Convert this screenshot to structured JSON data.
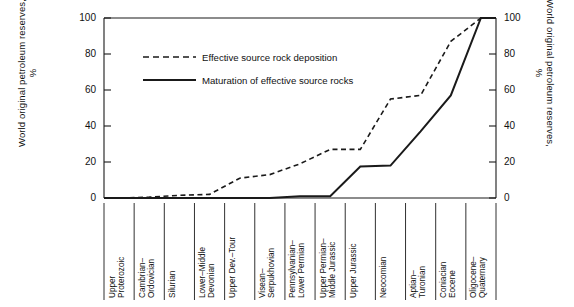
{
  "chart_data": {
    "type": "line",
    "title": "",
    "subtitle": "",
    "xlabel": "",
    "ylabel": "World original petroleum reserves, %",
    "ylabel_right": "World original petroleum reserves, %",
    "ylim": [
      0,
      100
    ],
    "yticks": [
      0,
      20,
      40,
      60,
      80,
      100
    ],
    "ytick_labels": [
      "0",
      "20",
      "40",
      "60",
      "80",
      "100"
    ],
    "ytick_labels_right": [
      "0",
      "20",
      "40",
      "60",
      "80",
      "100"
    ],
    "grid": false,
    "legend_position": "upper-left-inside",
    "categories": [
      "Upper\nProterozoic",
      "Cambrian–\nOrdovician",
      "Silurian",
      "Lower–Middle\nDevonian",
      "Upper Dev.–Tour",
      "Visean–\nSerpukhovian",
      "Pennsylvanian–\nLower Permian",
      "Upper Permian–\nMiddle Jurassic",
      "Upper Jurassic",
      "Neocomian",
      "Aptian–\nTuronian",
      "Coniacian\nEocene",
      "Oligocene–\nQuaternary"
    ],
    "series": [
      {
        "name": "Effective source rock deposition",
        "style": "dashed",
        "color": "#1a1a1a",
        "values": [
          0,
          0.5,
          1.5,
          2.0,
          11.0,
          13.0,
          19.0,
          27.0,
          27.0,
          55.0,
          57.0,
          87.0,
          100.0
        ]
      },
      {
        "name": "Maturation of effective source rocks",
        "style": "solid",
        "color": "#1a1a1a",
        "values": [
          0,
          0,
          0,
          0,
          0,
          0,
          1.0,
          1.0,
          17.5,
          18.0,
          37.0,
          57.0,
          100.0
        ]
      }
    ],
    "legend": [
      {
        "label": "Effective source rock deposition",
        "style": "dashed"
      },
      {
        "label": "Maturation of effective source rocks",
        "style": "solid"
      }
    ]
  }
}
